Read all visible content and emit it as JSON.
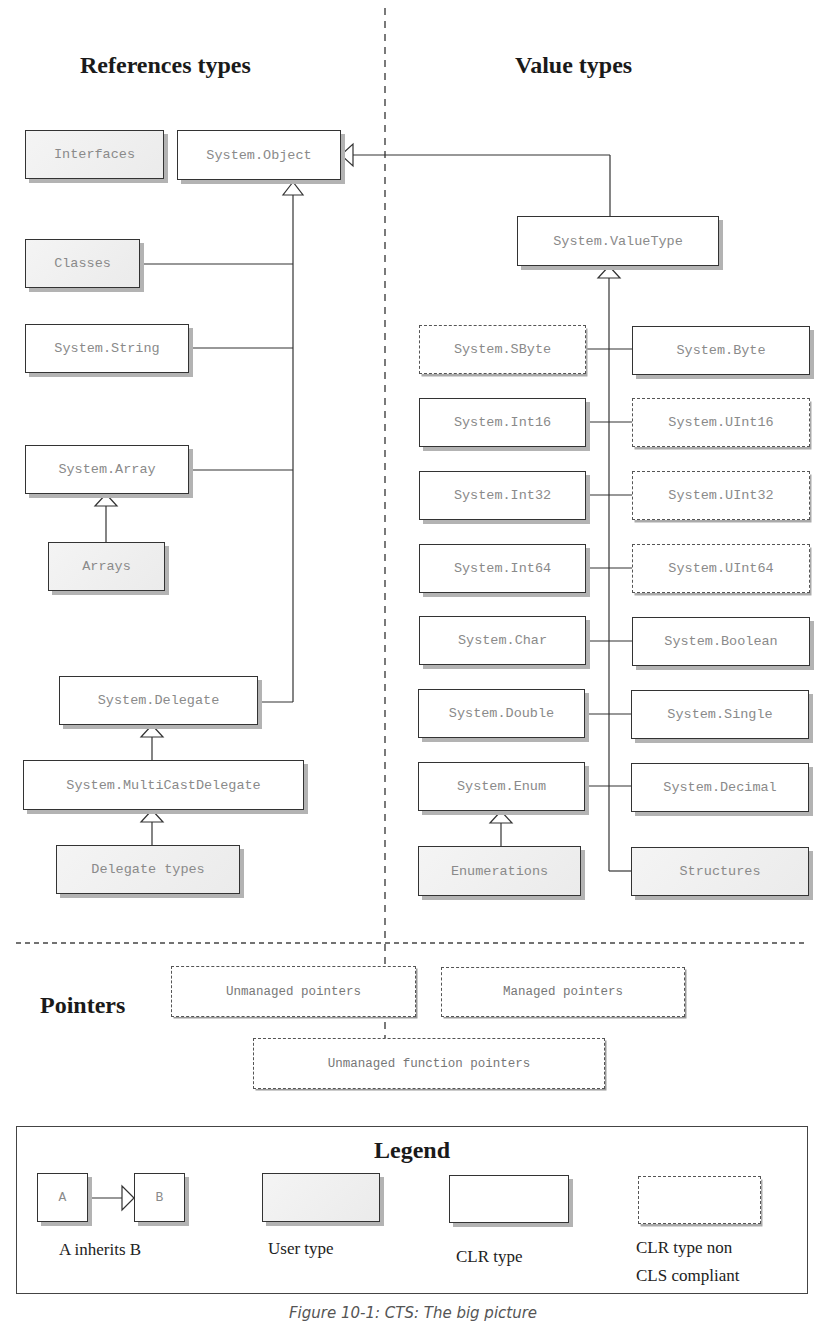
{
  "headings": {
    "reference_types": "References types",
    "value_types": "Value types",
    "pointers": "Pointers"
  },
  "reference_types": {
    "interfaces": "Interfaces",
    "system_object": "System.Object",
    "classes": "Classes",
    "system_string": "System.String",
    "system_array": "System.Array",
    "arrays": "Arrays",
    "system_delegate": "System.Delegate",
    "system_multicastdelegate": "System.MultiCastDelegate",
    "delegate_types": "Delegate types"
  },
  "value_types": {
    "system_valuetype": "System.ValueType",
    "system_sbyte": "System.SByte",
    "system_byte": "System.Byte",
    "system_int16": "System.Int16",
    "system_uint16": "System.UInt16",
    "system_int32": "System.Int32",
    "system_uint32": "System.UInt32",
    "system_int64": "System.Int64",
    "system_uint64": "System.UInt64",
    "system_char": "System.Char",
    "system_boolean": "System.Boolean",
    "system_double": "System.Double",
    "system_single": "System.Single",
    "system_enum": "System.Enum",
    "system_decimal": "System.Decimal",
    "enumerations": "Enumerations",
    "structures": "Structures"
  },
  "pointers": {
    "unmanaged": "Unmanaged pointers",
    "managed": "Managed pointers",
    "unmanaged_function": "Unmanaged function pointers"
  },
  "legend": {
    "title": "Legend",
    "a": "A",
    "b": "B",
    "inherits_label": "A inherits B",
    "user_type_label": "User type",
    "clr_type_label": "CLR type",
    "non_cls_label_line1": "CLR type non",
    "non_cls_label_line2": "CLS compliant"
  },
  "caption": "Figure 10-1: CTS: The big picture"
}
